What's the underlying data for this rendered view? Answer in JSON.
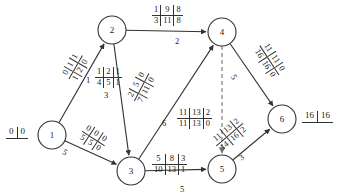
{
  "diagram": {
    "stroke_color": "#333333",
    "text_color": "#1a1a1a",
    "nodes": [
      {
        "id": "1",
        "label": "1",
        "x": 52,
        "y": 135,
        "r": 14,
        "potential": {
          "left": "0",
          "right": "0"
        },
        "potential_x": 6,
        "potential_y": 127
      },
      {
        "id": "2",
        "label": "2",
        "x": 112,
        "y": 30,
        "r": 14,
        "potential": null
      },
      {
        "id": "3",
        "label": "3",
        "x": 131,
        "y": 171,
        "r": 14,
        "potential": null
      },
      {
        "id": "4",
        "label": "4",
        "x": 222,
        "y": 32,
        "r": 14,
        "potential": null
      },
      {
        "id": "5",
        "label": "5",
        "x": 222,
        "y": 169,
        "r": 14,
        "potential": null
      },
      {
        "id": "6",
        "label": "6",
        "x": 282,
        "y": 119,
        "r": 14,
        "potential": {
          "left": "16",
          "right": "16"
        },
        "potential_x": 302,
        "potential_y": 111
      }
    ],
    "edges": [
      {
        "id": "e12",
        "from": "1",
        "to": "2",
        "style": "solid",
        "arrow": true,
        "top": [
          "0",
          "1",
          "1"
        ],
        "bottom": [
          "1",
          "2",
          "0"
        ],
        "weight": "1",
        "tag_x": 62,
        "tag_y": 57,
        "tag_rot": -60,
        "wt_x": 86,
        "wt_y": 75,
        "wt_rot": 0
      },
      {
        "id": "e13",
        "from": "1",
        "to": "3",
        "style": "solid",
        "arrow": true,
        "top": [
          "0",
          "0",
          "0"
        ],
        "bottom": [
          "5",
          "5",
          "0"
        ],
        "weight": "5",
        "tag_x": 80,
        "tag_y": 128,
        "tag_rot": 33,
        "wt_x": 63,
        "wt_y": 147,
        "wt_rot": 33
      },
      {
        "id": "e23",
        "from": "2",
        "to": "3",
        "style": "solid",
        "arrow": true,
        "top": [
          "1",
          "2",
          "1"
        ],
        "bottom": [
          "4",
          "5",
          "1"
        ],
        "weight": "3",
        "tag_x": 95,
        "tag_y": 67,
        "tag_rot": 0,
        "wt_x": 104,
        "wt_y": 90,
        "wt_rot": 0
      },
      {
        "id": "e24",
        "from": "2",
        "to": "4",
        "style": "solid",
        "arrow": true,
        "top": [
          "1",
          "9",
          "8"
        ],
        "bottom": [
          "3",
          "11",
          "8"
        ],
        "weight": "2",
        "tag_x": 152,
        "tag_y": 5,
        "tag_rot": 0,
        "wt_x": 175,
        "wt_y": 36,
        "wt_rot": 0
      },
      {
        "id": "e34",
        "from": "3",
        "to": "4",
        "style": "solid",
        "arrow": true,
        "top": [
          "2",
          "5",
          "0"
        ],
        "bottom": [
          "7",
          "11",
          "0"
        ],
        "weight": "6",
        "tag_x": 126,
        "tag_y": 77,
        "tag_rot": -62,
        "wt_x": 162,
        "wt_y": 118,
        "wt_rot": 0
      },
      {
        "id": "e35",
        "from": "3",
        "to": "5",
        "style": "solid",
        "arrow": true,
        "top": [
          "5",
          "8",
          "3"
        ],
        "bottom": [
          "10",
          "13",
          "1"
        ],
        "weight": "5",
        "tag_x": 152,
        "tag_y": 154,
        "tag_rot": 0,
        "wt_x": 180,
        "wt_y": 184,
        "wt_rot": 0
      },
      {
        "id": "e45",
        "from": "4",
        "to": "5",
        "style": "dashed",
        "arrow": true,
        "top": [
          "11",
          "13",
          "2"
        ],
        "bottom": [
          "11",
          "13",
          "0"
        ],
        "weight": "",
        "tag_x": 177,
        "tag_y": 108,
        "tag_rot": 0,
        "wt_x": 0,
        "wt_y": 0,
        "wt_rot": 0
      },
      {
        "id": "e46",
        "from": "4",
        "to": "6",
        "style": "solid",
        "arrow": true,
        "top": [
          "11",
          "11",
          "0"
        ],
        "bottom": [
          "16",
          "16",
          "0"
        ],
        "weight": "5",
        "tag_x": 252,
        "tag_y": 50,
        "tag_rot": 57,
        "wt_x": 232,
        "wt_y": 72,
        "wt_rot": 57
      },
      {
        "id": "e56",
        "from": "5",
        "to": "6",
        "style": "solid",
        "arrow": true,
        "top": [
          "11",
          "13",
          "2"
        ],
        "bottom": [
          "14",
          "16",
          "2"
        ],
        "weight": "3",
        "tag_x": 212,
        "tag_y": 124,
        "tag_rot": -40,
        "wt_x": 239,
        "wt_y": 152,
        "wt_rot": -40
      }
    ]
  }
}
